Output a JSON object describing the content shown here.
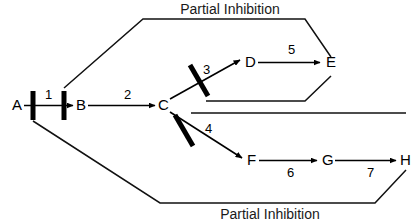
{
  "diagram": {
    "background_color": "#ffffff",
    "line_color": "#000000",
    "captions": [
      {
        "id": "caption-top",
        "text": "Partial Inhibition",
        "x": 230,
        "y": 14
      },
      {
        "id": "caption-bottom",
        "text": "Partial Inhibition",
        "x": 270,
        "y": 219
      }
    ],
    "nodes": [
      {
        "id": "A",
        "label": "A",
        "x": 12,
        "y": 110
      },
      {
        "id": "B",
        "label": "B",
        "x": 76,
        "y": 110
      },
      {
        "id": "C",
        "label": "C",
        "x": 158,
        "y": 110
      },
      {
        "id": "D",
        "label": "D",
        "x": 245,
        "y": 67
      },
      {
        "id": "E",
        "label": "E",
        "x": 326,
        "y": 67
      },
      {
        "id": "F",
        "label": "F",
        "x": 247,
        "y": 165
      },
      {
        "id": "G",
        "label": "G",
        "x": 322,
        "y": 165
      },
      {
        "id": "H",
        "label": "H",
        "x": 400,
        "y": 165
      }
    ],
    "steps": [
      {
        "id": "step-1",
        "label": "1",
        "x": 45,
        "y": 99,
        "from": "A",
        "to": "B"
      },
      {
        "id": "step-2",
        "label": "2",
        "x": 124,
        "y": 99,
        "from": "B",
        "to": "C"
      },
      {
        "id": "step-3",
        "label": "3",
        "x": 203,
        "y": 74,
        "from": "C",
        "to": "D"
      },
      {
        "id": "step-4",
        "label": "4",
        "x": 205,
        "y": 133,
        "from": "C",
        "to": "F"
      },
      {
        "id": "step-5",
        "label": "5",
        "x": 288,
        "y": 54,
        "from": "D",
        "to": "E"
      },
      {
        "id": "step-6",
        "label": "6",
        "x": 287,
        "y": 177,
        "from": "F",
        "to": "G"
      },
      {
        "id": "step-7",
        "label": "7",
        "x": 367,
        "y": 177,
        "from": "G",
        "to": "H"
      }
    ],
    "inhibition_bars": [
      {
        "id": "bar-step-1-left",
        "orientation": "vertical",
        "x1": 33,
        "y1": 91,
        "x2": 33,
        "y2": 120,
        "width": 5
      },
      {
        "id": "bar-step-1-right",
        "orientation": "vertical",
        "x1": 64,
        "y1": 91,
        "x2": 64,
        "y2": 120,
        "width": 5
      },
      {
        "id": "bar-step-3",
        "orientation": "diagonal",
        "x1": 190,
        "y1": 65,
        "x2": 208,
        "y2": 96,
        "width": 5
      },
      {
        "id": "bar-step-4",
        "orientation": "diagonal",
        "x1": 175,
        "y1": 115,
        "x2": 193,
        "y2": 146,
        "width": 5
      }
    ],
    "feedback_loops": [
      {
        "id": "loop-top",
        "source": "E",
        "target": "step-1",
        "caption": "Partial Inhibition",
        "points": "64,88 143,19 305,19 331,57"
      },
      {
        "id": "loop-top-return",
        "source": "E",
        "target": "bar-step-3",
        "points": "331,76 305,101 206,101"
      },
      {
        "id": "loop-bottom-return",
        "source": "H",
        "target": "bar-step-4",
        "points": "191,113 406,113"
      },
      {
        "id": "loop-bottom",
        "source": "H",
        "target": "step-1",
        "caption": "Partial Inhibition",
        "points": "33,121 160,203 375,203 406,170"
      }
    ]
  }
}
